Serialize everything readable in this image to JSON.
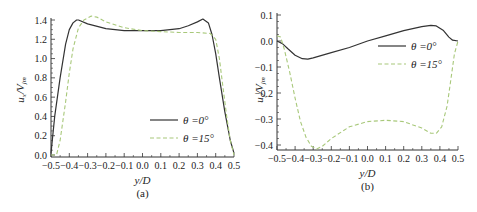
{
  "chart_data": [
    {
      "panel": "(a)",
      "type": "line",
      "xlabel": "y/D",
      "ylabel": "u_x/V_jm",
      "xlim": [
        -0.5,
        0.5
      ],
      "ylim": [
        0.0,
        1.4
      ],
      "xticks": [
        "-0.5",
        "-0.4",
        "-0.3",
        "-0.2",
        "-0.1",
        "0.0",
        "0.1",
        "0.2",
        "0.3",
        "0.4",
        "0.5"
      ],
      "yticks": [
        "0.0",
        "0.2",
        "0.4",
        "0.6",
        "0.8",
        "1.0",
        "1.2",
        "1.4"
      ],
      "legend_position": "lower right",
      "series": [
        {
          "name": "θ=0°",
          "style": "solid",
          "color": "#333333",
          "x": [
            -0.5,
            -0.48,
            -0.45,
            -0.42,
            -0.4,
            -0.38,
            -0.36,
            -0.35,
            -0.3,
            -0.2,
            -0.1,
            0.0,
            0.1,
            0.2,
            0.25,
            0.3,
            0.33,
            0.36,
            0.38,
            0.4,
            0.42,
            0.45,
            0.48,
            0.5
          ],
          "y": [
            0.02,
            0.4,
            0.8,
            1.15,
            1.3,
            1.37,
            1.4,
            1.4,
            1.36,
            1.31,
            1.29,
            1.29,
            1.29,
            1.31,
            1.34,
            1.38,
            1.41,
            1.37,
            1.25,
            1.05,
            0.8,
            0.45,
            0.15,
            0.02
          ]
        },
        {
          "name": "θ=15°",
          "style": "dashed",
          "color": "#a8c87a",
          "x": [
            -0.5,
            -0.47,
            -0.45,
            -0.42,
            -0.4,
            -0.38,
            -0.35,
            -0.32,
            -0.28,
            -0.25,
            -0.2,
            -0.1,
            0.0,
            0.1,
            0.2,
            0.3,
            0.37,
            0.4,
            0.42,
            0.44,
            0.46,
            0.48,
            0.5
          ],
          "y": [
            0.0,
            0.0,
            0.15,
            0.55,
            0.85,
            1.1,
            1.32,
            1.4,
            1.44,
            1.43,
            1.38,
            1.32,
            1.29,
            1.28,
            1.27,
            1.27,
            1.26,
            1.2,
            1.0,
            0.7,
            0.4,
            0.15,
            0.0
          ]
        }
      ]
    },
    {
      "panel": "(b)",
      "type": "line",
      "xlabel": "y/D",
      "ylabel": "u_y/V_jm",
      "xlim": [
        -0.5,
        0.5
      ],
      "ylim": [
        -0.45,
        0.1
      ],
      "xticks": [
        "-0.5",
        "-0.4",
        "-0.3",
        "-0.2",
        "-0.1",
        "0.0",
        "0.1",
        "0.2",
        "0.3",
        "0.4",
        "0.5"
      ],
      "yticks": [
        "0.1",
        "0.0",
        "-0.1",
        "-0.2",
        "-0.3",
        "-0.4"
      ],
      "legend_position": "upper right",
      "series": [
        {
          "name": "θ=0°",
          "style": "solid",
          "color": "#333333",
          "x": [
            -0.5,
            -0.47,
            -0.44,
            -0.4,
            -0.36,
            -0.33,
            -0.3,
            -0.2,
            -0.1,
            0.0,
            0.1,
            0.2,
            0.3,
            0.35,
            0.38,
            0.42,
            0.45,
            0.47,
            0.5
          ],
          "y": [
            0.0,
            -0.01,
            -0.03,
            -0.055,
            -0.068,
            -0.07,
            -0.065,
            -0.045,
            -0.025,
            0.0,
            0.02,
            0.04,
            0.055,
            0.06,
            0.058,
            0.04,
            0.015,
            0.003,
            0.0
          ]
        },
        {
          "name": "θ=15°",
          "style": "dashed",
          "color": "#a8c87a",
          "x": [
            -0.5,
            -0.48,
            -0.46,
            -0.43,
            -0.4,
            -0.37,
            -0.34,
            -0.31,
            -0.28,
            -0.25,
            -0.2,
            -0.1,
            0.0,
            0.1,
            0.2,
            0.3,
            0.35,
            0.38,
            0.41,
            0.44,
            0.46,
            0.48,
            0.5
          ],
          "y": [
            0.02,
            0.015,
            -0.03,
            -0.12,
            -0.22,
            -0.31,
            -0.37,
            -0.405,
            -0.415,
            -0.405,
            -0.375,
            -0.33,
            -0.31,
            -0.305,
            -0.31,
            -0.335,
            -0.355,
            -0.355,
            -0.33,
            -0.25,
            -0.15,
            -0.05,
            0.0
          ]
        }
      ]
    }
  ],
  "panels": {
    "a": {
      "caption": "(a)",
      "xlabel": "y/D",
      "ylabel_main": "u",
      "ylabel_sub": "x",
      "ylabel_den": "V",
      "ylabel_den_sub": "jm",
      "legend": [
        "θ =0°",
        "θ =15°"
      ]
    },
    "b": {
      "caption": "(b)",
      "xlabel": "y/D",
      "ylabel_main": "u",
      "ylabel_sub": "y",
      "ylabel_den": "V",
      "ylabel_den_sub": "jm",
      "legend": [
        "θ =0°",
        "θ =15°"
      ]
    }
  },
  "colors": {
    "solid": "#333333",
    "dashed": "#a8c87a",
    "axis": "#333333"
  }
}
